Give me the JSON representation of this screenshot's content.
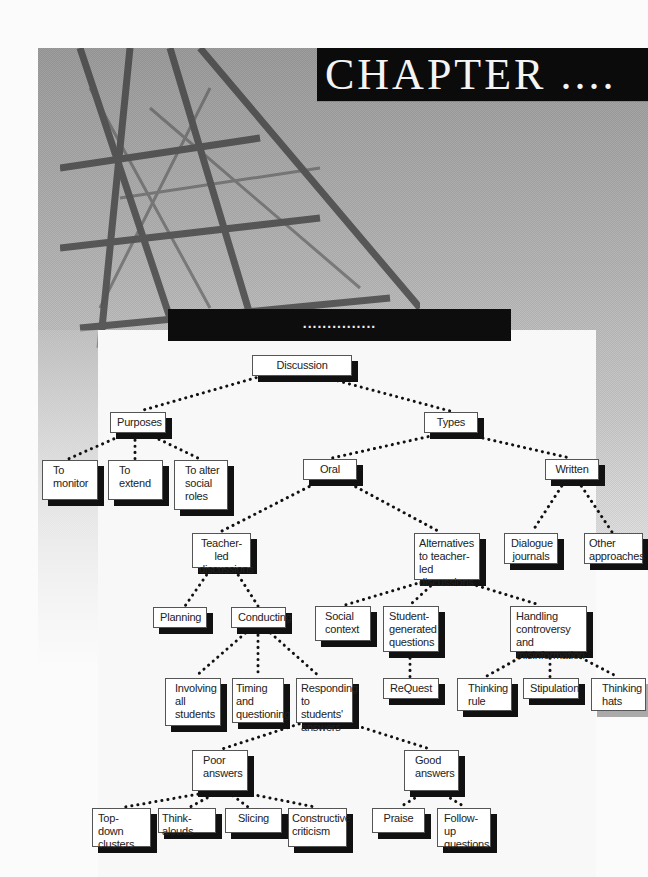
{
  "header": {
    "chapter_label": "CHAPTER ....",
    "section_label": "..............."
  },
  "diagram": {
    "root": "Discussion",
    "nodes": {
      "discussion": "Discussion",
      "purposes": "Purposes",
      "to_monitor": "To monitor",
      "to_extend": "To extend",
      "to_alter": "To alter social roles",
      "types": "Types",
      "oral": "Oral",
      "written": "Written",
      "teacher_led": "Teacher-led discussions",
      "alternatives": "Alternatives to teacher-led discussions",
      "dialogue_journals": "Dialogue journals",
      "other_approaches": "Other approaches",
      "planning": "Planning",
      "conducting": "Conducting",
      "social_context": "Social context",
      "student_generated": "Student-generated questions",
      "handling": "Handling controversy and misinformation",
      "involving": "Involving all students",
      "timing": "Timing and questioning",
      "responding": "Responding to students' answers",
      "request": "ReQuest",
      "thinking_rule": "Thinking rule",
      "stipulation": "Stipulation",
      "thinking_hats": "Thinking hats",
      "poor_answers": "Poor answers",
      "good_answers": "Good answers",
      "top_down": "Top-down clusters",
      "think_alouds": "Think-alouds",
      "slicing": "Slicing",
      "constructive": "Constructive criticism",
      "praise": "Praise",
      "follow_up": "Follow-up questions"
    },
    "edges": [
      [
        "Discussion",
        "Purposes"
      ],
      [
        "Discussion",
        "Types"
      ],
      [
        "Purposes",
        "To monitor"
      ],
      [
        "Purposes",
        "To extend"
      ],
      [
        "Purposes",
        "To alter social roles"
      ],
      [
        "Types",
        "Oral"
      ],
      [
        "Types",
        "Written"
      ],
      [
        "Written",
        "Dialogue journals"
      ],
      [
        "Written",
        "Other approaches"
      ],
      [
        "Oral",
        "Teacher-led discussions"
      ],
      [
        "Oral",
        "Alternatives to teacher-led discussions"
      ],
      [
        "Teacher-led discussions",
        "Planning"
      ],
      [
        "Teacher-led discussions",
        "Conducting"
      ],
      [
        "Alternatives to teacher-led discussions",
        "Social context"
      ],
      [
        "Alternatives to teacher-led discussions",
        "Student-generated questions"
      ],
      [
        "Alternatives to teacher-led discussions",
        "Handling controversy and misinformation"
      ],
      [
        "Conducting",
        "Involving all students"
      ],
      [
        "Conducting",
        "Timing and questioning"
      ],
      [
        "Conducting",
        "Responding to students' answers"
      ],
      [
        "Student-generated questions",
        "ReQuest"
      ],
      [
        "Handling controversy and misinformation",
        "Thinking rule"
      ],
      [
        "Handling controversy and misinformation",
        "Stipulation"
      ],
      [
        "Handling controversy and misinformation",
        "Thinking hats"
      ],
      [
        "Responding to students' answers",
        "Poor answers"
      ],
      [
        "Responding to students' answers",
        "Good answers"
      ],
      [
        "Poor answers",
        "Top-down clusters"
      ],
      [
        "Poor answers",
        "Think-alouds"
      ],
      [
        "Poor answers",
        "Slicing"
      ],
      [
        "Poor answers",
        "Constructive criticism"
      ],
      [
        "Good answers",
        "Praise"
      ],
      [
        "Good answers",
        "Follow-up questions"
      ]
    ]
  }
}
